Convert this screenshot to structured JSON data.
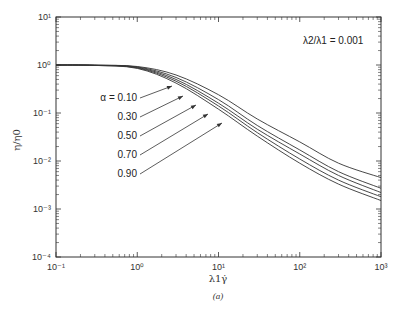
{
  "chart_data": {
    "type": "line",
    "title": "",
    "xlabel": "λ1γ̇",
    "ylabel": "η/η0",
    "caption": "(a)",
    "xscale": "log",
    "yscale": "log",
    "xlim": [
      0.1,
      1000
    ],
    "ylim": [
      0.0001,
      10
    ],
    "grid": false,
    "x_tick_labels": [
      "10⁻¹",
      "10⁰",
      "10¹",
      "10²",
      "10³"
    ],
    "y_tick_labels": [
      "10¹",
      "10⁰",
      "10⁻¹",
      "10⁻²",
      "10⁻³",
      "10⁻⁴"
    ],
    "annotation": "λ2/λ1 = 0.001",
    "x": [
      0.1,
      0.3,
      1,
      3,
      10,
      30,
      100,
      300,
      1000
    ],
    "series": [
      {
        "name": "α = 0.10",
        "values": [
          1.0,
          0.99,
          0.93,
          0.62,
          0.24,
          0.075,
          0.025,
          0.009,
          0.0045
        ]
      },
      {
        "name": "α = 0.30",
        "values": [
          1.0,
          0.99,
          0.91,
          0.55,
          0.19,
          0.055,
          0.017,
          0.006,
          0.0027
        ]
      },
      {
        "name": "α = 0.50",
        "values": [
          1.0,
          0.99,
          0.89,
          0.5,
          0.16,
          0.046,
          0.014,
          0.005,
          0.0022
        ]
      },
      {
        "name": "α = 0.70",
        "values": [
          1.0,
          0.98,
          0.87,
          0.46,
          0.14,
          0.039,
          0.011,
          0.004,
          0.0018
        ]
      },
      {
        "name": "α = 0.90",
        "values": [
          1.0,
          0.98,
          0.85,
          0.42,
          0.12,
          0.033,
          0.009,
          0.0033,
          0.0015
        ]
      }
    ],
    "legend": [
      "α = 0.10",
      "0.30",
      "0.50",
      "0.70",
      "0.90"
    ],
    "legend_position": "inline labels with arrows, left-center"
  },
  "labels": {
    "annotation": "λ2/λ1 = 0.001",
    "xlabel": "λ1γ̇",
    "ylabel": "η/η0",
    "caption": "(a)",
    "alpha_labels": [
      "α = 0.10",
      "0.30",
      "0.50",
      "0.70",
      "0.90"
    ]
  }
}
